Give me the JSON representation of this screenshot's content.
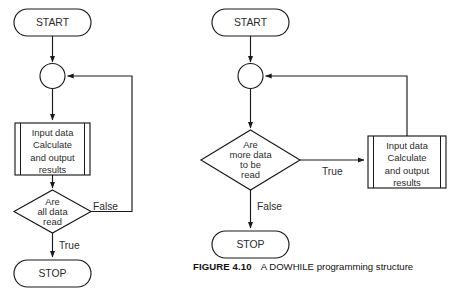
{
  "figure": {
    "caption_label": "FIGURE 4.10",
    "caption_title": "A DOWHILE programming structure"
  },
  "diagram_data": {
    "type": "diagram",
    "subtype": "flowchart",
    "title": "A DOWHILE programming structure",
    "colors": {
      "stroke": "#1a1a1a",
      "text": "#2b2b2b",
      "background": "#ffffff"
    },
    "charts": [
      {
        "id": "left-flowchart",
        "name": "repeat-until-structure",
        "nodes": [
          {
            "id": "l-start",
            "type": "terminator",
            "label": "START"
          },
          {
            "id": "l-junction",
            "type": "connector-circle",
            "label": ""
          },
          {
            "id": "l-process",
            "type": "predefined-process",
            "label": "Input data Calculate and output results",
            "lines": [
              "Input data",
              "Calculate",
              "and output",
              "results"
            ]
          },
          {
            "id": "l-decision",
            "type": "decision",
            "label": "Are all data read",
            "lines": [
              "Are",
              "all data",
              "read"
            ]
          },
          {
            "id": "l-stop",
            "type": "terminator",
            "label": "STOP"
          }
        ],
        "edges": [
          {
            "from": "l-start",
            "to": "l-junction",
            "label": ""
          },
          {
            "from": "l-junction",
            "to": "l-process",
            "label": ""
          },
          {
            "from": "l-process",
            "to": "l-decision",
            "label": ""
          },
          {
            "from": "l-decision",
            "to": "l-junction",
            "label": "False"
          },
          {
            "from": "l-decision",
            "to": "l-stop",
            "label": "True"
          }
        ]
      },
      {
        "id": "right-flowchart",
        "name": "dowhile-structure",
        "nodes": [
          {
            "id": "r-start",
            "type": "terminator",
            "label": "START"
          },
          {
            "id": "r-junction",
            "type": "connector-circle",
            "label": ""
          },
          {
            "id": "r-decision",
            "type": "decision",
            "label": "Are more data to be read",
            "lines": [
              "Are",
              "more data",
              "to be",
              "read"
            ]
          },
          {
            "id": "r-process",
            "type": "predefined-process",
            "label": "Input data Calculate and output results",
            "lines": [
              "Input data",
              "Calculate",
              "and output",
              "results"
            ]
          },
          {
            "id": "r-stop",
            "type": "terminator",
            "label": "STOP"
          }
        ],
        "edges": [
          {
            "from": "r-start",
            "to": "r-junction",
            "label": ""
          },
          {
            "from": "r-junction",
            "to": "r-decision",
            "label": ""
          },
          {
            "from": "r-decision",
            "to": "r-process",
            "label": "True"
          },
          {
            "from": "r-process",
            "to": "r-junction",
            "label": ""
          },
          {
            "from": "r-decision",
            "to": "r-stop",
            "label": "False"
          }
        ]
      }
    ]
  },
  "left": {
    "start_label": "START",
    "process": {
      "line1": "Input data",
      "line2": "Calculate",
      "line3": "and output",
      "line4": "results"
    },
    "decision": {
      "line1": "Are",
      "line2": "all data",
      "line3": "read"
    },
    "false_label": "False",
    "true_label": "True",
    "stop_label": "STOP"
  },
  "right": {
    "start_label": "START",
    "decision": {
      "line1": "Are",
      "line2": "more data",
      "line3": "to be",
      "line4": "read"
    },
    "process": {
      "line1": "Input data",
      "line2": "Calculate",
      "line3": "and output",
      "line4": "results"
    },
    "true_label": "True",
    "false_label": "False",
    "stop_label": "STOP"
  }
}
